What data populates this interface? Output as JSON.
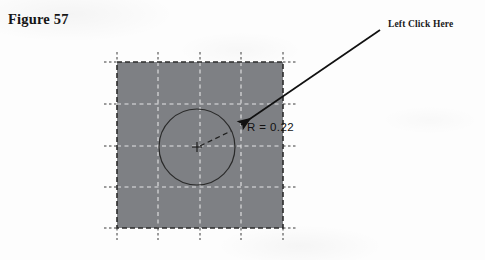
{
  "figure": {
    "title": "Figure 57",
    "callout_label": "Left Click Here",
    "radius_label": "R = 0.22"
  },
  "colors": {
    "page_background": "#fdfdfd",
    "shape_fill": "#7e8084",
    "shape_border": "#2b2b2b",
    "inner_gridline": "#e4e4e6",
    "outer_gridline": "#3a3a3a",
    "circle_stroke": "#2a2a2a",
    "arrow": "#111111",
    "title_text": "#161616",
    "label_text": "#1a1a1a"
  },
  "geometry": {
    "square": {
      "x": 117,
      "y": 62,
      "width": 166,
      "height": 166
    },
    "grid": {
      "vertical_x": [
        117,
        158,
        200,
        241,
        283
      ],
      "horizontal_y": [
        62,
        104,
        146,
        187,
        228
      ],
      "stub_length": 10,
      "cells": 4
    },
    "circle": {
      "cx": 197,
      "cy": 147,
      "r": 38
    },
    "center_marker": {
      "x": 197,
      "y": 147,
      "size": 5
    },
    "radius_line": {
      "x1": 200,
      "y1": 146,
      "x2": 231,
      "y2": 131
    },
    "arrow": {
      "tail_x": 380,
      "tail_y": 30,
      "tip_x": 236,
      "tip_y": 128
    }
  }
}
